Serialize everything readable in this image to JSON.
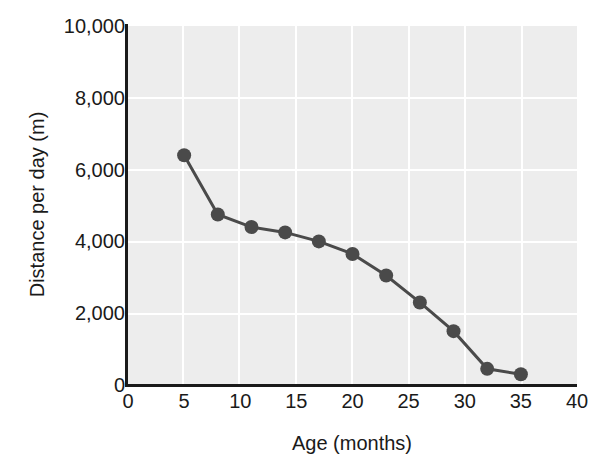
{
  "chart_data": {
    "type": "line",
    "title": "",
    "xlabel": "Age (months)",
    "ylabel": "Distance per day (m)",
    "x": [
      5,
      8,
      11,
      14,
      17,
      20,
      23,
      26,
      29,
      32,
      35
    ],
    "values": [
      6400,
      4750,
      4400,
      4250,
      4000,
      3650,
      3050,
      2300,
      1500,
      450,
      300
    ],
    "series": [
      {
        "name": "Distance per day",
        "values": [
          6400,
          4750,
          4400,
          4250,
          4000,
          3650,
          3050,
          2300,
          1500,
          450,
          300
        ]
      }
    ],
    "xlim": [
      0,
      40
    ],
    "ylim": [
      0,
      10000
    ],
    "xticks": [
      "0",
      "5",
      "10",
      "15",
      "20",
      "25",
      "30",
      "35",
      "40"
    ],
    "xtick_values": [
      0,
      5,
      10,
      15,
      20,
      25,
      30,
      35,
      40
    ],
    "yticks": [
      "0",
      "2,000",
      "4,000",
      "6,000",
      "8,000",
      "10,000"
    ],
    "ytick_values": [
      0,
      2000,
      4000,
      6000,
      8000,
      10000
    ],
    "grid": true,
    "legend": "none",
    "marker": "filled-circle",
    "colors": {
      "line": "#4a4a4a",
      "marker": "#4a4a4a",
      "plot_background": "#ededed",
      "gridline": "#ffffff",
      "axis": "#1a1a1a",
      "text": "#1a1a1a",
      "page_background": "#ffffff"
    }
  }
}
